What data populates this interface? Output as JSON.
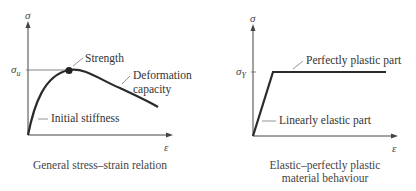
{
  "diagrams": [
    {
      "caption": "General stress–strain relation",
      "y_axis_symbol": "σ",
      "x_axis_symbol": "ε",
      "level_symbol": "σ",
      "level_subscript": "u",
      "annotations": {
        "strength": "Strength",
        "deformation_line1": "Deformation",
        "deformation_line2": "capacity",
        "initial_stiffness": "Initial stiffness"
      }
    },
    {
      "caption_line1": "Elastic–perfectly plastic",
      "caption_line2": "material behaviour",
      "y_axis_symbol": "σ",
      "x_axis_symbol": "ε",
      "level_symbol": "σ",
      "level_subscript": "Y",
      "annotations": {
        "plastic": "Perfectly plastic part",
        "elastic": "Linearly elastic part"
      }
    }
  ],
  "colors": {
    "curve": "#2a2a2a",
    "axis": "#444444",
    "leader": "#888888"
  }
}
